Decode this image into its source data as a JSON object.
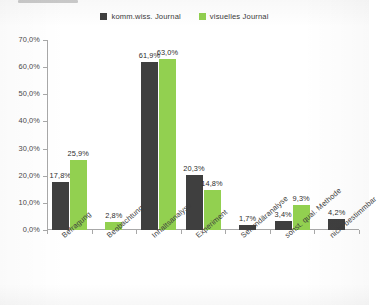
{
  "legend": {
    "position": "top-center",
    "entries": [
      {
        "label": "komm.wiss. Journal",
        "color": "#3F3F3F",
        "swatch_name": "legend-swatch-komm-wiss"
      },
      {
        "label": "visuelles Journal",
        "color": "#92D050",
        "swatch_name": "legend-swatch-visuelles"
      }
    ]
  },
  "colors": {
    "series_1": "#3F3F3F",
    "series_2": "#92D050",
    "axis": "#a8a8a8",
    "text": "#3a3a3a",
    "background": "#ffffff"
  },
  "axis": {
    "y_ticks": [
      "0,0%",
      "10,0%",
      "20,0%",
      "30,0%",
      "40,0%",
      "50,0%",
      "60,0%",
      "70,0%"
    ],
    "y_min": 0,
    "y_max": 70,
    "y_step": 10
  },
  "chart_data": {
    "type": "bar",
    "title": "",
    "subtitle": "",
    "xlabel": "",
    "ylabel": "",
    "ylim": [
      0,
      70
    ],
    "grid": false,
    "legend_position": "top-center",
    "value_suffix": "%",
    "decimal_separator": ",",
    "categories": [
      "Befragung",
      "Beobachtung",
      "Inhaltsanalyse",
      "Experiment",
      "Sekundäranalyse",
      "sonst. qual. Methode",
      "nicht bestimmbar"
    ],
    "series": [
      {
        "name": "komm.wiss. Journal",
        "color": "#3F3F3F",
        "values": [
          17.8,
          null,
          61.9,
          20.3,
          1.7,
          3.4,
          4.2
        ],
        "labels": [
          "17,8%",
          null,
          "61,9%",
          "20,3%",
          "1,7%",
          "3,4%",
          "4,2%"
        ]
      },
      {
        "name": "visuelles Journal",
        "color": "#92D050",
        "values": [
          25.9,
          2.8,
          63.0,
          14.8,
          null,
          9.3,
          null
        ],
        "labels": [
          "25,9%",
          "2,8%",
          "63,0%",
          "14,8%",
          null,
          "9,3%",
          null
        ]
      }
    ]
  }
}
